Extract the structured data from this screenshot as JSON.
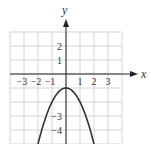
{
  "chart_data": {
    "type": "line",
    "title": "",
    "xlabel": "x",
    "ylabel": "y",
    "xlim": [
      -4,
      4
    ],
    "ylim": [
      -5,
      3
    ],
    "grid": true,
    "function": "y = -x^2 - 1",
    "series": [
      {
        "name": "parabola",
        "x": [
          -2,
          -1.5,
          -1,
          -0.5,
          0,
          0.5,
          1,
          1.5,
          2
        ],
        "y": [
          -5,
          -3.25,
          -2,
          -1.25,
          -1,
          -1.25,
          -2,
          -3.25,
          -5
        ]
      }
    ],
    "x_tick_labels": [
      {
        "value": -3,
        "label": "−3"
      },
      {
        "value": -2,
        "label": "−2"
      },
      {
        "value": -1,
        "label": "−1"
      },
      {
        "value": 1,
        "label": "1"
      },
      {
        "value": 2,
        "label": "2"
      },
      {
        "value": 3,
        "label": "3"
      }
    ],
    "y_tick_labels": [
      {
        "value": 2,
        "label": "2"
      },
      {
        "value": 1,
        "label": "1"
      },
      {
        "value": -3,
        "label": "−3"
      },
      {
        "value": -4,
        "label": "−4"
      }
    ]
  }
}
